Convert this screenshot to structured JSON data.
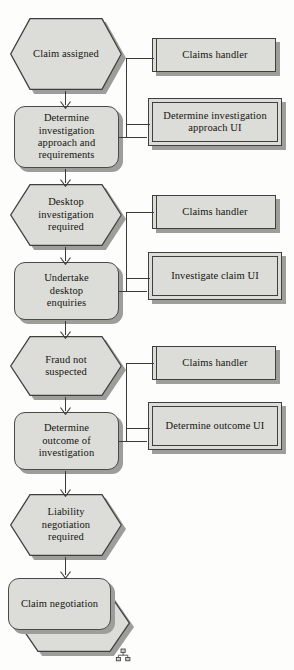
{
  "diagram": {
    "type": "flowchart",
    "colors": {
      "fill": "#dcdcd8",
      "stroke": "#3f3f3b",
      "shadow": "#9d9d99",
      "background": "#fdfdfc",
      "text": "#15150f"
    },
    "events": [
      {
        "id": "claim-assigned",
        "label": "Claim assigned",
        "lines": [
          "Claim assigned"
        ]
      },
      {
        "id": "desktop-investigation-required",
        "label": "Desktop investigation required",
        "lines": [
          "Desktop",
          "investigation",
          "required"
        ]
      },
      {
        "id": "fraud-not-suspected",
        "label": "Fraud not suspected",
        "lines": [
          "Fraud not",
          "suspected"
        ]
      },
      {
        "id": "liability-negotiation-required",
        "label": "Liability negotiation required",
        "lines": [
          "Liability",
          "negotiation",
          "required"
        ]
      }
    ],
    "activities": [
      {
        "id": "determine-investigation-approach",
        "label": "Determine investigation approach and requirements",
        "lines": [
          "Determine",
          "investigation",
          "approach and",
          "requirements"
        ]
      },
      {
        "id": "undertake-desktop-enquiries",
        "label": "Undertake desktop enquiries",
        "lines": [
          "Undertake",
          "desktop",
          "enquiries"
        ]
      },
      {
        "id": "determine-outcome-of-investigation",
        "label": "Determine outcome of investigation",
        "lines": [
          "Determine",
          "outcome of",
          "investigation"
        ]
      },
      {
        "id": "claim-negotiation",
        "label": "Claim negotiation",
        "lines": [
          "Claim negotiation"
        ],
        "is_subprocess": true
      }
    ],
    "actors": [
      {
        "id": "claims-handler-1",
        "label": "Claims handler"
      },
      {
        "id": "claims-handler-2",
        "label": "Claims handler"
      },
      {
        "id": "claims-handler-3",
        "label": "Claims handler"
      }
    ],
    "systems": [
      {
        "id": "determine-investigation-approach-ui",
        "label": "Determine investigation approach UI",
        "lines": [
          "Determine investigation",
          "approach UI"
        ]
      },
      {
        "id": "investigate-claim-ui",
        "label": "Investigate claim UI",
        "lines": [
          "Investigate claim UI"
        ]
      },
      {
        "id": "determine-outcome-ui",
        "label": "Determine outcome UI",
        "lines": [
          "Determine outcome UI"
        ]
      }
    ],
    "markers": [
      {
        "id": "subprocess-marker",
        "icon": "hierarchy-icon",
        "attached_to": "claim-negotiation"
      }
    ]
  }
}
